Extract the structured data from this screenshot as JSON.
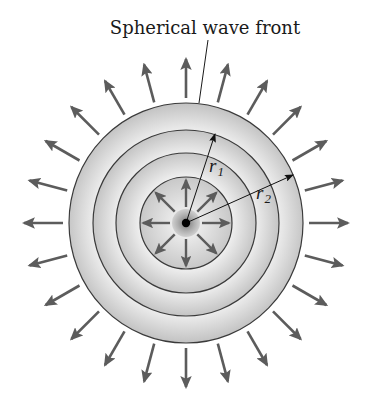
{
  "diagram": {
    "title": "Spherical wave front",
    "labels": {
      "r1": {
        "symbol": "r",
        "subscript": "1"
      },
      "r2": {
        "symbol": "r",
        "subscript": "2"
      }
    }
  },
  "geometry": {
    "center": [
      186,
      223
    ],
    "outer_front": {
      "rx": 117,
      "ry": 120
    },
    "wave_fronts_radii": [
      93,
      70,
      46
    ],
    "source_radius": 14,
    "source_dot_radius": 4,
    "outer_ray_count": 24,
    "outer_ray_start": [
      123,
      125
    ],
    "outer_ray_end": [
      162,
      164
    ],
    "inner_ray_count": 8,
    "inner_ray_start": 16,
    "inner_ray_end": 43,
    "r1_tip": [
      215,
      133
    ],
    "r2_tip": [
      294,
      174
    ],
    "leader_line": [
      [
        208,
        40
      ],
      [
        199,
        103
      ]
    ]
  },
  "colors": {
    "background": "#ffffff",
    "band_light": "#ececec",
    "band_dark": "#c4c4c4",
    "outline": "#3a3a3a",
    "ray": "#5c5c5c",
    "source_light": "#d8d8d8",
    "source_dark": "#9a9a9a",
    "dot": "#000000",
    "text": "#1a1a1a"
  }
}
